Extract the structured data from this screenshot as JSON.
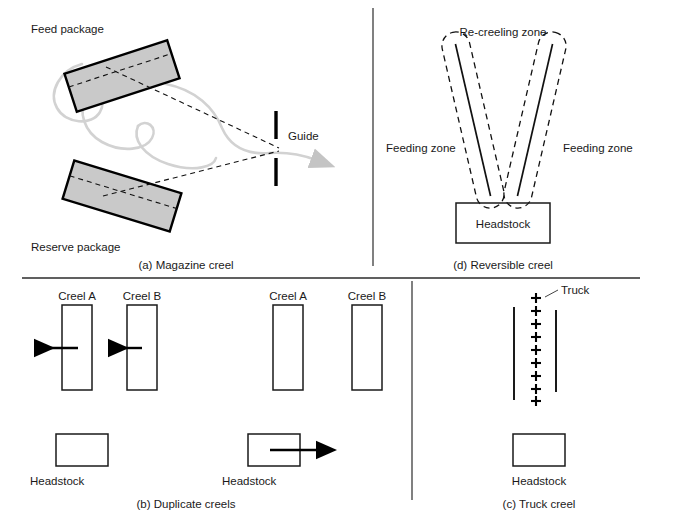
{
  "figure": {
    "panels": [
      {
        "id": "a",
        "caption": "(a) Magazine creel",
        "labels": {
          "feed_package": "Feed package",
          "reserve_package": "Reserve package",
          "guide": "Guide"
        }
      },
      {
        "id": "d",
        "caption": "(d) Reversible creel",
        "labels": {
          "recreeling_zone": "Re-creeling zone",
          "feeding_zone_left": "Feeding zone",
          "feeding_zone_right": "Feeding zone",
          "headstock": "Headstock"
        }
      },
      {
        "id": "b",
        "caption": "(b) Duplicate creels",
        "labels": {
          "creel_a_left": "Creel A",
          "creel_b_left": "Creel B",
          "creel_a_right": "Creel A",
          "creel_b_right": "Creel B",
          "headstock_left": "Headstock",
          "headstock_right": "Headstock"
        }
      },
      {
        "id": "c",
        "caption": "(c) Truck creel",
        "labels": {
          "truck": "Truck",
          "headstock": "Headstock"
        },
        "truck_marks": 9
      }
    ],
    "colors": {
      "package_fill": "#c9c9c9",
      "outline": "#000000",
      "yarn": "#d2d2d2",
      "divider": "#4a4a4a",
      "text": "#1a1a1a"
    }
  }
}
